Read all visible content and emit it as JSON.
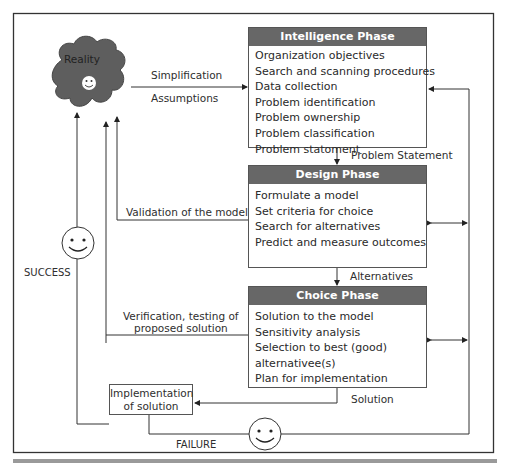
{
  "reality": {
    "label": "Reality"
  },
  "edges": {
    "simplification": "Simplification",
    "assumptions": "Assumptions",
    "problem_statement": "Problem Statement",
    "alternatives": "Alternatives",
    "solution": "Solution",
    "validation": "Validation of the model",
    "verification_line1": "Verification, testing of",
    "verification_line2": "proposed solution",
    "success": "SUCCESS",
    "failure": "FAILURE"
  },
  "phases": [
    {
      "title": "Intelligence Phase",
      "items": [
        "Organization objectives",
        "Search and scanning procedures",
        "Data collection",
        "Problem identification",
        "Problem ownership",
        "Problem classification",
        "Problem statoment"
      ]
    },
    {
      "title": "Design Phase",
      "items": [
        "Formulate a model",
        "Set criteria for choice",
        "Search for alternatives",
        "Predict and measure outcomes"
      ]
    },
    {
      "title": "Choice Phase",
      "items": [
        "Solution to the model",
        "Sensitivity analysis",
        "Selection to best (good)",
        "alternativee(s)",
        "Plan for implementation"
      ]
    }
  ],
  "implementation": {
    "line1": "Implementation",
    "line2": "of solution"
  },
  "colors": {
    "header": "#676767",
    "cloud": "#5e5e5e",
    "line": "#333333",
    "bottom_bar": "#9a9a9a"
  }
}
